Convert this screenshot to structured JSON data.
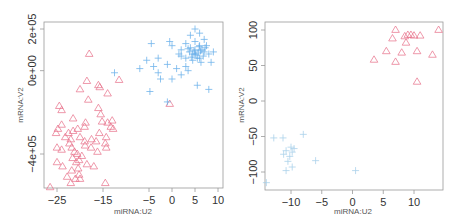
{
  "chart_data": [
    {
      "type": "scatter",
      "title": "",
      "xlabel": "miRNA:U2",
      "ylabel": "mRNA:V2",
      "xlim": [
        -27,
        10
      ],
      "ylim": [
        -580000,
        250000
      ],
      "x_ticks": [
        "-25",
        "-15",
        "-5",
        "0",
        "5",
        "10"
      ],
      "x_tick_values": [
        -25,
        -15,
        -5,
        0,
        5,
        10
      ],
      "y_ticks": [
        "2e+05",
        "0e+00",
        "-4e+05"
      ],
      "y_tick_values": [
        200000,
        0,
        -400000
      ],
      "grid": false,
      "legend": null,
      "series": [
        {
          "name": "group-triangle",
          "marker": "triangle-open",
          "color": "#e8718a",
          "points": [
            [
              -18,
              80000
            ],
            [
              -18.5,
              -50000
            ],
            [
              -16,
              -70000
            ],
            [
              -15.7,
              -80000
            ],
            [
              -14,
              -110000
            ],
            [
              -20,
              -90000
            ],
            [
              -18.2,
              -140000
            ],
            [
              -11.5,
              -45000
            ],
            [
              -24,
              -190000
            ],
            [
              -21.5,
              -230000
            ],
            [
              -16,
              -180000
            ],
            [
              -15.5,
              -210000
            ],
            [
              -15.2,
              -245000
            ],
            [
              -14,
              -250000
            ],
            [
              -13,
              -240000
            ],
            [
              -13.3,
              -270000
            ],
            [
              -18.8,
              -250000
            ],
            [
              -19,
              -270000
            ],
            [
              -20.5,
              -280000
            ],
            [
              -21.5,
              -290000
            ],
            [
              -22.5,
              -300000
            ],
            [
              -24,
              -260000
            ],
            [
              -24.8,
              -280000
            ],
            [
              -25.2,
              -300000
            ],
            [
              -23.2,
              -320000
            ],
            [
              -22,
              -330000
            ],
            [
              -20,
              -320000
            ],
            [
              -19,
              -340000
            ],
            [
              -17.5,
              -330000
            ],
            [
              -16.5,
              -340000
            ],
            [
              -15.8,
              -300000
            ],
            [
              -14.3,
              -320000
            ],
            [
              -12.8,
              -280000
            ],
            [
              -25,
              -370000
            ],
            [
              -24,
              -380000
            ],
            [
              -22.3,
              -350000
            ],
            [
              -21.8,
              -370000
            ],
            [
              -21.2,
              -390000
            ],
            [
              -20.6,
              -400000
            ],
            [
              -21.6,
              -420000
            ],
            [
              -20.8,
              -440000
            ],
            [
              -20.2,
              -430000
            ],
            [
              -19.6,
              -410000
            ],
            [
              -18.9,
              -360000
            ],
            [
              -17.6,
              -370000
            ],
            [
              -16.2,
              -390000
            ],
            [
              -14.5,
              -350000
            ],
            [
              -14.3,
              -370000
            ],
            [
              -25,
              -440000
            ],
            [
              -23.8,
              -460000
            ],
            [
              -21.8,
              -480000
            ],
            [
              -20.4,
              -470000
            ],
            [
              -20.2,
              -500000
            ],
            [
              -18.5,
              -450000
            ],
            [
              -22.8,
              -510000
            ],
            [
              -21,
              -520000
            ],
            [
              -20,
              -520000
            ],
            [
              -22,
              -540000
            ],
            [
              -17,
              -460000
            ],
            [
              -26.5,
              -560000
            ],
            [
              -14.5,
              -540000
            ],
            [
              -0.5,
              -160000
            ],
            [
              -24.5,
              -170000
            ]
          ]
        },
        {
          "name": "group-plus",
          "marker": "plus",
          "color": "#5aa8e8",
          "points": [
            [
              -12.5,
              -10000
            ],
            [
              -7,
              10000
            ],
            [
              -3,
              -10000
            ],
            [
              -4,
              20000
            ],
            [
              -2.5,
              -40000
            ],
            [
              -1,
              30000
            ],
            [
              0,
              -40000
            ],
            [
              1,
              10000
            ],
            [
              2,
              -20000
            ],
            [
              3.5,
              0
            ],
            [
              3,
              60000
            ],
            [
              2,
              70000
            ],
            [
              4.5,
              50000
            ],
            [
              5,
              100000
            ],
            [
              6,
              120000
            ],
            [
              7,
              90000
            ],
            [
              8,
              80000
            ],
            [
              5.5,
              60000
            ],
            [
              4.5,
              80000
            ],
            [
              6.5,
              100000
            ],
            [
              5,
              140000
            ],
            [
              6.3,
              40000
            ],
            [
              7.5,
              120000
            ],
            [
              3,
              130000
            ],
            [
              4,
              170000
            ],
            [
              5,
              200000
            ],
            [
              6,
              180000
            ],
            [
              8.5,
              40000
            ],
            [
              9,
              90000
            ],
            [
              2,
              100000
            ],
            [
              1.5,
              80000
            ],
            [
              -4.5,
              130000
            ],
            [
              -3,
              60000
            ],
            [
              0,
              120000
            ],
            [
              -0.5,
              140000
            ],
            [
              8,
              -90000
            ],
            [
              5.5,
              -70000
            ],
            [
              -4.8,
              -100000
            ],
            [
              -1,
              -150000
            ],
            [
              -5.5,
              50000
            ],
            [
              3,
              20000
            ],
            [
              7,
              150000
            ],
            [
              4,
              110000
            ],
            [
              6,
              60000
            ],
            [
              5,
              80000
            ],
            [
              4.8,
              95000
            ],
            [
              5.7,
              85000
            ],
            [
              6.8,
              70000
            ],
            [
              3.8,
              90000
            ],
            [
              5.2,
              75000
            ],
            [
              6.2,
              95000
            ],
            [
              4.2,
              65000
            ],
            [
              7.2,
              110000
            ],
            [
              5.9,
              115000
            ],
            [
              3.5,
              105000
            ]
          ]
        }
      ]
    },
    {
      "type": "scatter",
      "title": "",
      "xlabel": "miRNA:U2",
      "ylabel": "mRNA:V2",
      "xlim": [
        -15,
        15
      ],
      "ylim": [
        -125,
        110
      ],
      "x_ticks": [
        "-10",
        "-5",
        "0",
        "5",
        "10"
      ],
      "x_tick_values": [
        -10,
        -5,
        0,
        5,
        10
      ],
      "y_ticks": [
        "100",
        "50",
        "0",
        "-50",
        "-100"
      ],
      "y_tick_values": [
        100,
        50,
        0,
        -50,
        -100
      ],
      "grid": false,
      "legend": null,
      "series": [
        {
          "name": "group-triangle",
          "marker": "triangle-open",
          "color": "#e8718a",
          "points": [
            [
              7,
              100
            ],
            [
              14,
              100
            ],
            [
              6.5,
              88
            ],
            [
              8.5,
              91
            ],
            [
              9,
              93
            ],
            [
              9.5,
              93
            ],
            [
              10,
              92
            ],
            [
              11,
              92
            ],
            [
              8.7,
              82
            ],
            [
              5.5,
              70
            ],
            [
              8,
              68
            ],
            [
              10.5,
              70
            ],
            [
              13,
              65
            ],
            [
              3.5,
              58
            ],
            [
              7,
              55
            ],
            [
              10.5,
              27
            ]
          ]
        },
        {
          "name": "group-plus",
          "marker": "plus",
          "color": "#9ecbe8",
          "points": [
            [
              -12.8,
              -52
            ],
            [
              -11.3,
              -52
            ],
            [
              -8,
              -47
            ],
            [
              -10,
              -65
            ],
            [
              -9.5,
              -67
            ],
            [
              -10.8,
              -70
            ],
            [
              -9.8,
              -72
            ],
            [
              -11.2,
              -75
            ],
            [
              -10.2,
              -78
            ],
            [
              -10.5,
              -85
            ],
            [
              -6,
              -84
            ],
            [
              -9.8,
              -93
            ],
            [
              -10.8,
              -98
            ],
            [
              0.5,
              -98
            ],
            [
              -14,
              -115
            ]
          ]
        }
      ]
    }
  ],
  "plots": [
    {
      "xlabel": "miRNA:U2",
      "ylabel": "mRNA:V2",
      "x_ticks": [
        "-25",
        "-15",
        "-5",
        "0",
        "5",
        "10"
      ],
      "y_ticks": [
        "2e+05",
        "0e+00",
        "-4e+05"
      ]
    },
    {
      "xlabel": "miRNA:U2",
      "ylabel": "mRNA:V2",
      "x_ticks": [
        "-10",
        "-5",
        "0",
        "5",
        "10"
      ],
      "y_ticks": [
        "100",
        "50",
        "0",
        "-50",
        "-100"
      ]
    }
  ]
}
